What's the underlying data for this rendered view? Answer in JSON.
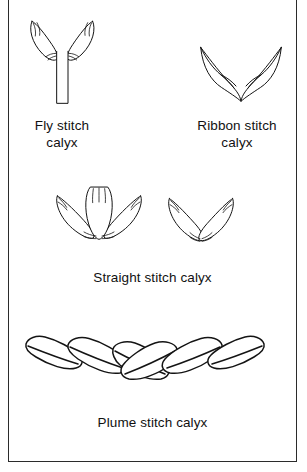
{
  "figure": {
    "background_color": "#ffffff",
    "border_color": "#2b2b2b",
    "ink_color": "#141414"
  },
  "diagrams": [
    {
      "id": "fly-stitch-calyx",
      "caption": "Fly stitch\ncalyx",
      "icon": "fly-stitch-calyx-icon",
      "petal_count": 2,
      "has_stem": true,
      "description": "Two petals forming a V above a long straight vertical stem"
    },
    {
      "id": "ribbon-stitch-calyx",
      "caption": "Ribbon stitch\ncalyx",
      "icon": "ribbon-stitch-calyx-icon",
      "petal_count": 2,
      "has_stem": false,
      "description": "Two pointed curled ribbon leaves meeting at a lower point"
    },
    {
      "id": "straight-stitch-calyx",
      "caption": "Straight stitch calyx",
      "icon": "straight-stitch-calyx-icon",
      "groups": [
        {
          "petal_count": 3,
          "description": "Three petals fanning from a common base"
        },
        {
          "petal_count": 2,
          "description": "Two petals forming a V from a common base"
        }
      ]
    },
    {
      "id": "plume-stitch-calyx",
      "caption": "Plume stitch calyx",
      "icon": "plume-stitch-calyx-icon",
      "segment_count": 6,
      "description": "Chain of overlapping rounded lozenges forming a shallow V arc"
    }
  ],
  "captions": {
    "fly": "Fly stitch\ncalyx",
    "ribbon": "Ribbon stitch\ncalyx",
    "straight": "Straight stitch calyx",
    "plume": "Plume stitch calyx"
  }
}
